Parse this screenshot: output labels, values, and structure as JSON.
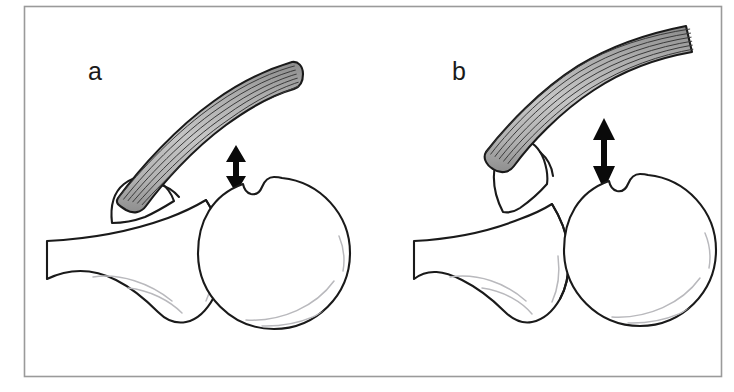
{
  "figure": {
    "caption_labels": {
      "panel_a": "a",
      "panel_b": "b"
    },
    "colors": {
      "background": "#ffffff",
      "outline": "#1a1a1a",
      "muscle_fill_light": "#c9c9c9",
      "muscle_fill_mid": "#a6a6a6",
      "muscle_fill_dark": "#8e8e8e",
      "muscle_stripe": "#3a3a3a",
      "inner_highlight": "#b9b9bd",
      "arrow": "#0a0a0a",
      "frame": "#9a9a9a"
    },
    "panels": [
      {
        "id": "a",
        "label": "a",
        "label_x": 88,
        "label_y": 80,
        "gap_label": "normal-acromiohumeral-interval",
        "arrow_name": "acromiohumeral-distance-arrow-a",
        "arrow_x": 236,
        "arrow_top": 147,
        "arrow_bottom": 191,
        "humeral_head_center_x": 274,
        "humeral_head_center_y": 253,
        "humeral_head_radius": 76
      },
      {
        "id": "b",
        "label": "b",
        "label_x": 452,
        "label_y": 80,
        "gap_label": "widened-acromiohumeral-interval",
        "arrow_name": "acromiohumeral-distance-arrow-b",
        "arrow_x": 604,
        "arrow_top": 120,
        "arrow_bottom": 186,
        "humeral_head_center_x": 640,
        "humeral_head_center_y": 250,
        "humeral_head_radius": 76
      }
    ],
    "frame": {
      "name": "figure-border",
      "x": 24,
      "y": 6,
      "width": 698,
      "height": 371
    }
  }
}
